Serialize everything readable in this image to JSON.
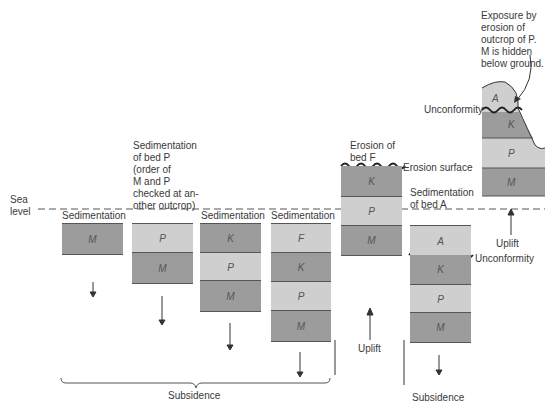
{
  "sea_level_label": "Sea\nlevel",
  "stages": [
    {
      "caption": "Sedimentation\nof bed M",
      "beds": [
        "M"
      ],
      "motion": "down"
    },
    {
      "caption": "Sedimentation\nof bed P\n(order of\nM and P\nchecked at an-\nother outcrop)",
      "beds": [
        "P",
        "M"
      ],
      "motion": "down"
    },
    {
      "caption": "Sedimentation\nof bed K",
      "beds": [
        "K",
        "P",
        "M"
      ],
      "motion": "down"
    },
    {
      "caption": "Sedimentation\nof bed F",
      "beds": [
        "F",
        "K",
        "P",
        "M"
      ],
      "motion": "down"
    },
    {
      "caption": "Erosion of\nbed F",
      "beds": [
        "K",
        "P",
        "M"
      ],
      "annotation": "Erosion surface",
      "motion": "up",
      "motion_label": "Uplift"
    },
    {
      "caption": "Sedimentation\nof bed A",
      "beds": [
        "A",
        "K",
        "P",
        "M"
      ],
      "annotation": "Unconformity",
      "motion": "down",
      "motion_label": "Subsidence"
    },
    {
      "caption": "Exposure by\nerosion of\noutcrop of P.\nM is hidden\nbelow ground.",
      "beds": [
        "A",
        "K",
        "P",
        "M"
      ],
      "annotation": "Unconformity",
      "motion": "up",
      "motion_label": "Uplift"
    }
  ],
  "brace_label": "Subsidence",
  "colors": {
    "light_bed": "#cfcfcf",
    "dark_bed": "#9c9c9c",
    "line": "#555555"
  }
}
